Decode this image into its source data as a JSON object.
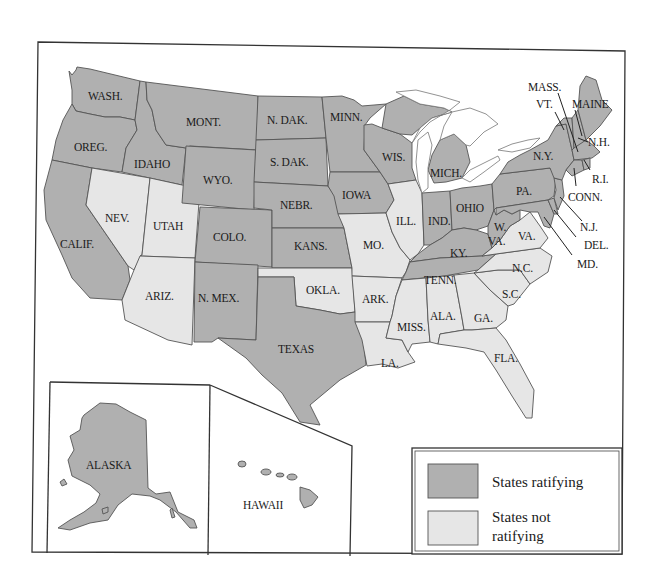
{
  "map": {
    "subject": "United States map showing states ratifying and not ratifying",
    "colors": {
      "ratifying": "#b0b0b0",
      "not_ratifying": "#e6e6e6",
      "border": "#555555",
      "frame": "#333333",
      "background": "#ffffff"
    },
    "legend": {
      "ratifying_label": "States ratifying",
      "not_ratifying_label_line1": "States not",
      "not_ratifying_label_line2": "ratifying"
    },
    "states": {
      "wash": {
        "label": "WASH.",
        "status": "ratifying"
      },
      "oreg": {
        "label": "OREG.",
        "status": "ratifying"
      },
      "calif": {
        "label": "CALIF.",
        "status": "ratifying"
      },
      "idaho": {
        "label": "IDAHO",
        "status": "ratifying"
      },
      "nev": {
        "label": "NEV.",
        "status": "not_ratifying"
      },
      "utah": {
        "label": "UTAH",
        "status": "not_ratifying"
      },
      "ariz": {
        "label": "ARIZ.",
        "status": "not_ratifying"
      },
      "mont": {
        "label": "MONT.",
        "status": "ratifying"
      },
      "wyo": {
        "label": "WYO.",
        "status": "ratifying"
      },
      "colo": {
        "label": "COLO.",
        "status": "ratifying"
      },
      "nmex": {
        "label": "N. MEX.",
        "status": "ratifying"
      },
      "ndak": {
        "label": "N. DAK.",
        "status": "ratifying"
      },
      "sdak": {
        "label": "S. DAK.",
        "status": "ratifying"
      },
      "nebr": {
        "label": "NEBR.",
        "status": "ratifying"
      },
      "kans": {
        "label": "KANS.",
        "status": "ratifying"
      },
      "okla": {
        "label": "OKLA.",
        "status": "not_ratifying"
      },
      "texas": {
        "label": "TEXAS",
        "status": "ratifying"
      },
      "minn": {
        "label": "MINN.",
        "status": "ratifying"
      },
      "iowa": {
        "label": "IOWA",
        "status": "ratifying"
      },
      "mo": {
        "label": "MO.",
        "status": "not_ratifying"
      },
      "ark": {
        "label": "ARK.",
        "status": "not_ratifying"
      },
      "la": {
        "label": "LA.",
        "status": "not_ratifying"
      },
      "wis": {
        "label": "WIS.",
        "status": "ratifying"
      },
      "ill": {
        "label": "ILL.",
        "status": "not_ratifying"
      },
      "mich": {
        "label": "MICH.",
        "status": "ratifying"
      },
      "ind": {
        "label": "IND.",
        "status": "ratifying"
      },
      "ohio": {
        "label": "OHIO",
        "status": "ratifying"
      },
      "ky": {
        "label": "KY.",
        "status": "ratifying"
      },
      "tenn": {
        "label": "TENN.",
        "status": "ratifying"
      },
      "miss": {
        "label": "MISS.",
        "status": "not_ratifying"
      },
      "ala": {
        "label": "ALA.",
        "status": "not_ratifying"
      },
      "ga": {
        "label": "GA.",
        "status": "not_ratifying"
      },
      "fla": {
        "label": "FLA.",
        "status": "not_ratifying"
      },
      "sc": {
        "label": "S.C.",
        "status": "not_ratifying"
      },
      "nc": {
        "label": "N.C.",
        "status": "not_ratifying"
      },
      "va": {
        "label": "VA.",
        "status": "not_ratifying"
      },
      "wva_line1": {
        "label": "W.",
        "status": "ratifying"
      },
      "wva_line2": {
        "label": "VA.",
        "status": "ratifying"
      },
      "pa": {
        "label": "PA.",
        "status": "ratifying"
      },
      "ny": {
        "label": "N.Y.",
        "status": "ratifying"
      },
      "vt": {
        "label": "VT.",
        "status": "ratifying"
      },
      "nh": {
        "label": "N.H.",
        "status": "ratifying"
      },
      "maine": {
        "label": "MAINE",
        "status": "ratifying"
      },
      "mass": {
        "label": "MASS.",
        "status": "ratifying"
      },
      "ri": {
        "label": "R.I.",
        "status": "ratifying"
      },
      "conn": {
        "label": "CONN.",
        "status": "ratifying"
      },
      "nj": {
        "label": "N.J.",
        "status": "ratifying"
      },
      "del": {
        "label": "DEL.",
        "status": "ratifying"
      },
      "md": {
        "label": "MD.",
        "status": "ratifying"
      },
      "alaska": {
        "label": "ALASKA",
        "status": "ratifying"
      },
      "hawaii": {
        "label": "HAWAII",
        "status": "ratifying"
      }
    }
  }
}
